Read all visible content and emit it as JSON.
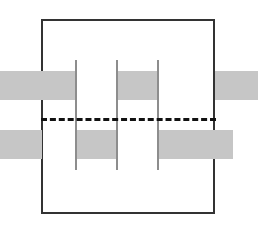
{
  "figure": {
    "canvas": {
      "width": 258,
      "height": 229,
      "background": "#ffffff"
    },
    "colors": {
      "bar_fill": "#c6c6c6",
      "frame_stroke": "#333333",
      "pillar_stroke": "#8d8d8d",
      "centerline_stroke": "#111111",
      "background": "#ffffff"
    },
    "frame": {
      "label": "outer-boundary-rectangle",
      "x": 41,
      "y": 19,
      "width": 174,
      "height": 195,
      "stroke_width": 2,
      "stroke": "#333333",
      "fill": "none"
    },
    "centerline": {
      "label": "horizontal-dashed-centerline",
      "x1": 41,
      "x2": 216,
      "y": 118,
      "stroke_width": 3,
      "stroke": "#111111",
      "dash_pattern": "5 4",
      "style": "dashed"
    },
    "pillars": [
      {
        "label": "pillar-1",
        "x": 75,
        "y": 60,
        "width": 2,
        "height": 110
      },
      {
        "label": "pillar-2",
        "x": 116,
        "y": 60,
        "width": 2,
        "height": 110
      },
      {
        "label": "pillar-3",
        "x": 157,
        "y": 60,
        "width": 2,
        "height": 110
      }
    ],
    "bars": [
      {
        "label": "bar-upper-left-outer",
        "position": "upper",
        "x": 0,
        "y": 71,
        "width": 76,
        "height": 29
      },
      {
        "label": "bar-upper-middle",
        "position": "upper",
        "x": 116,
        "y": 71,
        "width": 42,
        "height": 29
      },
      {
        "label": "bar-upper-right-outer",
        "position": "upper",
        "x": 215,
        "y": 71,
        "width": 43,
        "height": 29
      },
      {
        "label": "bar-lower-left-outer",
        "position": "lower",
        "x": 0,
        "y": 130,
        "width": 42,
        "height": 29
      },
      {
        "label": "bar-lower-middle",
        "position": "lower",
        "x": 75,
        "y": 130,
        "width": 42,
        "height": 29
      },
      {
        "label": "bar-lower-right",
        "position": "lower",
        "x": 157,
        "y": 130,
        "width": 76,
        "height": 29
      }
    ]
  }
}
